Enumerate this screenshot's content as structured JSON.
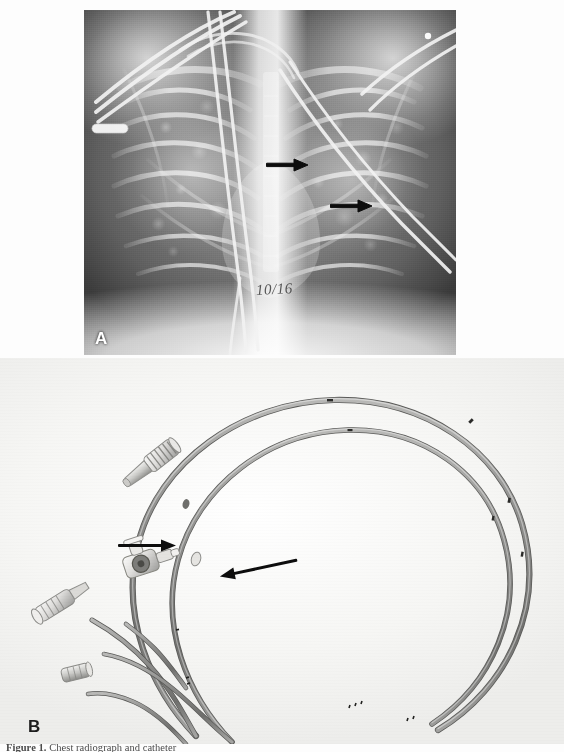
{
  "figure": {
    "panels": [
      {
        "id": "A",
        "letter": "A",
        "type": "radiograph",
        "modality": "chest-radiograph",
        "annotations": {
          "handwritten_date": "10/16",
          "arrows": [
            {
              "name": "arrow-upper",
              "label": "",
              "x": 284,
              "y": 155,
              "angle": 0
            },
            {
              "name": "arrow-lower",
              "label": "",
              "x": 348,
              "y": 196,
              "angle": 0
            }
          ]
        }
      },
      {
        "id": "B",
        "letter": "B",
        "type": "photograph",
        "subject": "multi-lumen catheter",
        "annotations": {
          "arrows": [
            {
              "name": "arrow-left",
              "label": "",
              "x": 163,
              "y": 545,
              "angle": 0
            },
            {
              "name": "arrow-right",
              "label": "",
              "x": 232,
              "y": 560,
              "angle": 200
            }
          ]
        }
      }
    ]
  },
  "caption": {
    "label": "Figure 1.",
    "text": "Chest radiograph and catheter"
  },
  "colors": {
    "panel_a_background": "#0b0b0b",
    "panel_b_background": "#f7f7f5",
    "arrow": "#111111",
    "letter": "#ffffff",
    "caption_text": "#4a4a4a"
  }
}
